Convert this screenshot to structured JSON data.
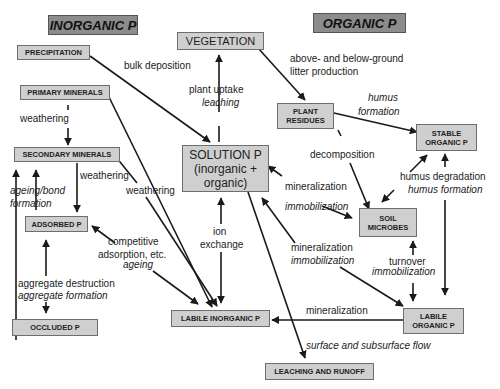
{
  "headings": {
    "inorganic": "INORGANIC P",
    "organic": "ORGANIC P"
  },
  "boxes": {
    "precipitation": "PRECIPITATION",
    "vegetation": "VEGETATION",
    "primary_minerals": "PRIMARY MINERALS",
    "plant_residues_1": "PLANT",
    "plant_residues_2": "RESIDUES",
    "stable_organic_1": "STABLE",
    "stable_organic_2": "ORGANIC P",
    "secondary_minerals": "SECONDARY MINERALS",
    "solution_1": "SOLUTION P",
    "solution_2": "(inorganic +",
    "solution_3": "organic)",
    "adsorbed": "ADSORBED P",
    "soil_microbes_1": "SOIL",
    "soil_microbes_2": "MICROBES",
    "occluded": "OCCLUDED P",
    "labile_inorganic": "LABILE INORGANIC P",
    "labile_organic_1": "LABILE",
    "labile_organic_2": "ORGANIC P",
    "leaching_runoff": "LEACHING AND RUNOFF"
  },
  "labels": {
    "bulk_deposition": "bulk deposition",
    "plant_uptake": "plant uptake",
    "leaching": "leaching",
    "litter_1": "above- and below-ground",
    "litter_2": "litter production",
    "humus_formation_1": "humus",
    "humus_formation_2": "formation",
    "weathering_1": "weathering",
    "weathering_2": "weathering",
    "weathering_3": "weathering",
    "decomposition": "decomposition",
    "humus_degradation": "humus degradation",
    "humus_formation_3": "humus formation",
    "ageing_bond_1": "ageing/bond",
    "ageing_bond_2": "formation",
    "mineralization_1": "mineralization",
    "immobilization_1": "immobilization",
    "ion": "ion",
    "exchange": "exchange",
    "competitive_1": "competitive",
    "competitive_2": "adsorption, etc.",
    "ageing": "ageing",
    "mineralization_2": "mineralization",
    "immobilization_2": "immobilization",
    "turnover": "turnover",
    "immobilization_3": "immobilization",
    "aggregate_destruction": "aggregate destruction",
    "aggregate_formation": "aggregate formation",
    "mineralization_3": "mineralization",
    "surface_flow": "surface and subsurface flow"
  },
  "colors": {
    "box_fill": "#cfcfcf",
    "heading_fill": "#8c8c8c",
    "line": "#1a1a1a"
  }
}
